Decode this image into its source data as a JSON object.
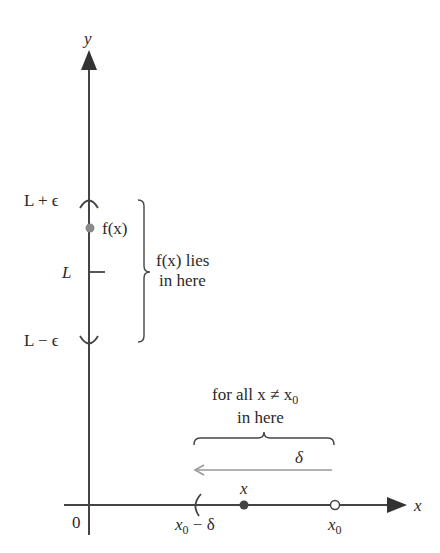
{
  "axes": {
    "y_label": "y",
    "x_label": "x",
    "origin_label": "0"
  },
  "y_axis_labels": {
    "upper": "L + ϵ",
    "middle": "L",
    "lower": "L − ϵ",
    "point": "f(x)"
  },
  "range_brace": {
    "line1": "f(x) lies",
    "line2": "in here"
  },
  "domain_brace": {
    "line1": "for all x ≠ x",
    "line1_sub": "0",
    "line2": "in here"
  },
  "delta_arrow": {
    "label": "δ"
  },
  "x_axis_labels": {
    "left_bound": "x",
    "left_bound_sub": "0",
    "left_bound_suffix": " − δ",
    "point": "x",
    "center": "x",
    "center_sub": "0"
  },
  "colors": {
    "axis": "#333333",
    "point_fill": "#8a8a8a",
    "arrow": "#999999",
    "brace": "#444444",
    "dot_x": "#444444"
  }
}
